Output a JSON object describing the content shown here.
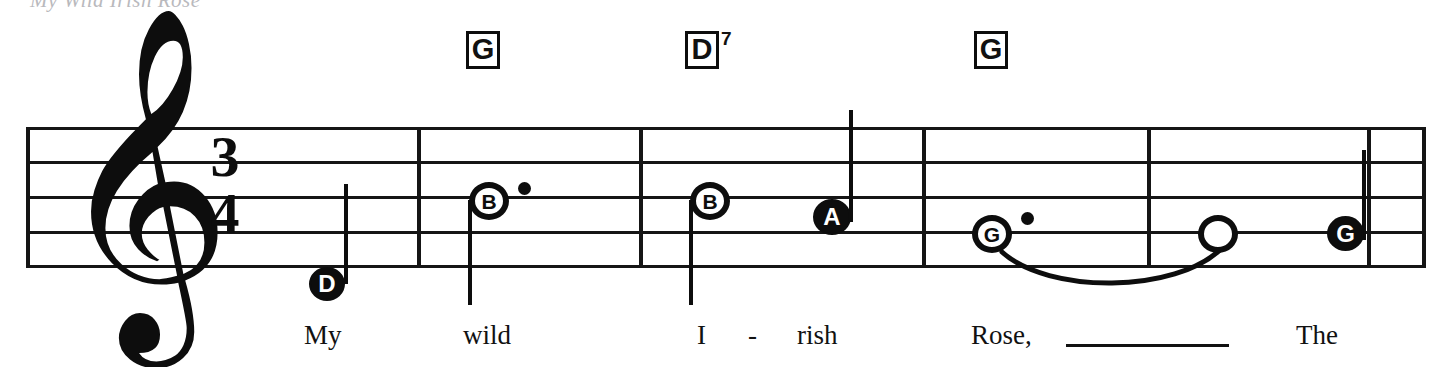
{
  "sheet": {
    "title_sliver": "My Wild Irish Rose",
    "ink_color": "#0d0d0d",
    "paper_color": "#ffffff"
  },
  "staff": {
    "clef": "treble-clef",
    "clef_glyph": "𝄞",
    "time_signature": {
      "beats": "3",
      "beat_type": "4"
    },
    "line_count": 5,
    "barline_count": 6
  },
  "chords": [
    {
      "name": "chord-g-1",
      "root": "G",
      "extension": "",
      "x": 466,
      "y": 31
    },
    {
      "name": "chord-d7",
      "root": "D",
      "extension": "7",
      "x": 685,
      "y": 31
    },
    {
      "name": "chord-g-2",
      "root": "G",
      "extension": "",
      "x": 974,
      "y": 31
    }
  ],
  "measures": [
    {
      "index": 1,
      "notes": [
        "D"
      ]
    },
    {
      "index": 2,
      "notes": [
        "B"
      ]
    },
    {
      "index": 3,
      "notes": [
        "B",
        "A"
      ]
    },
    {
      "index": 4,
      "notes": [
        "G"
      ]
    },
    {
      "index": 5,
      "notes": [
        "(tied)",
        "G"
      ]
    }
  ],
  "notes": [
    {
      "name": "note-d-quarter",
      "letter": "D",
      "head": "filled",
      "dotted": false,
      "stem": "up",
      "cx": 327,
      "cy": 284
    },
    {
      "name": "note-b-dotted-half",
      "letter": "B",
      "head": "open",
      "dotted": true,
      "stem": "down",
      "cx": 489,
      "cy": 200
    },
    {
      "name": "note-b-half",
      "letter": "B",
      "head": "open",
      "dotted": false,
      "stem": "down",
      "cx": 710,
      "cy": 200
    },
    {
      "name": "note-a-quarter",
      "letter": "A",
      "head": "filled",
      "dotted": false,
      "stem": "up",
      "cx": 831,
      "cy": 217
    },
    {
      "name": "note-g-dotted-half",
      "letter": "G",
      "head": "open",
      "dotted": true,
      "stem": "none",
      "cx": 992,
      "cy": 233
    },
    {
      "name": "note-g-tied-open",
      "letter": "",
      "head": "open",
      "dotted": false,
      "stem": "none",
      "cx": 1218,
      "cy": 233
    },
    {
      "name": "note-g-quarter",
      "letter": "G",
      "head": "filled",
      "dotted": false,
      "stem": "up",
      "cx": 1345,
      "cy": 233
    }
  ],
  "lyrics": [
    {
      "name": "lyric-my",
      "text": "My",
      "x": 304,
      "y": 322
    },
    {
      "name": "lyric-wild",
      "text": "wild",
      "x": 463,
      "y": 322
    },
    {
      "name": "lyric-i",
      "text": "I",
      "x": 697,
      "y": 322
    },
    {
      "name": "lyric-hyphen",
      "text": "-",
      "x": 748,
      "y": 322
    },
    {
      "name": "lyric-rish",
      "text": "rish",
      "x": 797,
      "y": 322
    },
    {
      "name": "lyric-rose",
      "text": "Rose,",
      "x": 971,
      "y": 322
    },
    {
      "name": "lyric-the",
      "text": "The",
      "x": 1296,
      "y": 322
    }
  ],
  "melisma": {
    "name": "melisma-line",
    "x": 1066,
    "y": 344,
    "width": 163
  }
}
